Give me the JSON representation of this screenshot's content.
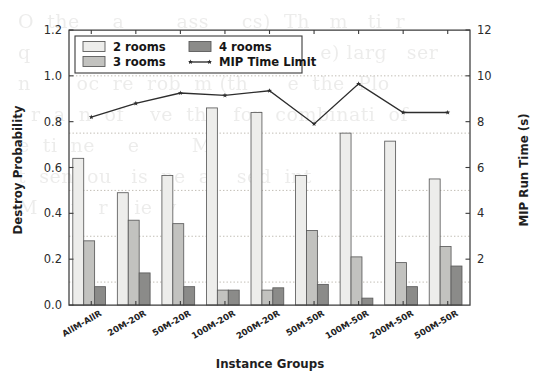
{
  "figure": {
    "background_color": "#ffffff",
    "bleed_through_text": "O  the     a        ass     cs)  Th   m   ti  r\nq       R  i    nd   to   o   ti        e) larg   ser\nn       oc  re  rob  m (th      e  the  Plo\n  r  a  n  of    ve  th    for  combinati  of\ne  ti  ne     e        M\nt  sen  ou   is  pe  al   sed  int\nM     t   r    ie  v\n"
  },
  "chart_data": {
    "type": "bar",
    "title": "",
    "xlabel": "Instance Groups",
    "ylabel": "Destroy Probability",
    "y2label": "MIP Run Time (s)",
    "ylim": [
      0.0,
      1.2
    ],
    "y2lim": [
      0,
      12
    ],
    "yticks": [
      "0.0",
      "0.2",
      "0.4",
      "0.6",
      "0.8",
      "1.0",
      "1.2"
    ],
    "ytick_values": [
      0.0,
      0.2,
      0.4,
      0.6,
      0.8,
      1.0,
      1.2
    ],
    "y2ticks": [
      "2",
      "4",
      "6",
      "8",
      "10",
      "12"
    ],
    "y2tick_values": [
      2,
      4,
      6,
      8,
      10,
      12
    ],
    "gridlines_y": [
      0.1,
      0.3,
      0.5,
      0.75,
      1.0
    ],
    "grid": true,
    "legend_position": "upper-left-inside",
    "categories": [
      "AllM-AllR",
      "20M-20R",
      "50M-20R",
      "100M-20R",
      "200M-20R",
      "50M-50R",
      "100M-50R",
      "200M-50R",
      "500M-50R"
    ],
    "series": [
      {
        "name": "2 rooms",
        "kind": "bar",
        "axis": "left",
        "color": "#ededeb",
        "edge_color": "#5b5b5b",
        "values": [
          0.64,
          0.49,
          0.565,
          0.86,
          0.84,
          0.565,
          0.75,
          0.715,
          0.55
        ]
      },
      {
        "name": "3 rooms",
        "kind": "bar",
        "axis": "left",
        "color": "#c2c2bf",
        "edge_color": "#5b5b5b",
        "values": [
          0.28,
          0.37,
          0.355,
          0.065,
          0.065,
          0.325,
          0.21,
          0.185,
          0.255
        ]
      },
      {
        "name": "4 rooms",
        "kind": "bar",
        "axis": "left",
        "color": "#8b8b89",
        "edge_color": "#5b5b5b",
        "values": [
          0.08,
          0.14,
          0.08,
          0.065,
          0.075,
          0.09,
          0.03,
          0.08,
          0.17
        ]
      },
      {
        "name": "MIP Time Limit",
        "kind": "line",
        "axis": "right",
        "color": "#2d2d2d",
        "marker": "star",
        "values": [
          8.2,
          8.8,
          9.25,
          9.15,
          9.35,
          7.9,
          9.65,
          8.4,
          8.4
        ]
      }
    ]
  },
  "legend": {
    "entries": [
      {
        "label": "2 rooms",
        "type": "swatch",
        "color": "#ededeb"
      },
      {
        "label": "4 rooms",
        "type": "swatch",
        "color": "#8b8b89"
      },
      {
        "label": "3 rooms",
        "type": "swatch",
        "color": "#c2c2bf"
      },
      {
        "label": "MIP Time Limit",
        "type": "line-marker",
        "color": "#2d2d2d"
      }
    ]
  }
}
